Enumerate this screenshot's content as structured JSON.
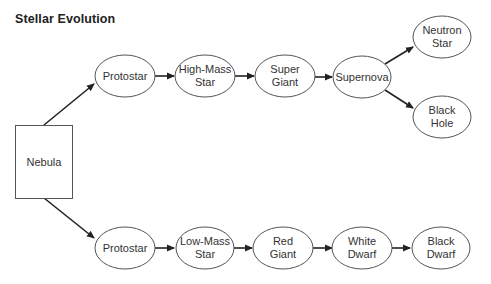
{
  "title": "Stellar Evolution",
  "colors": {
    "background": "#ffffff",
    "stroke": "#555555",
    "arrow": "#222222",
    "text": "#333333"
  },
  "nodes": {
    "nebula": {
      "label_lines": [
        "Nebula"
      ],
      "shape": "rect"
    },
    "protostar_high": {
      "label_lines": [
        "Protostar"
      ],
      "shape": "ellipse"
    },
    "high_mass_star": {
      "label_lines": [
        "High-Mass",
        "Star"
      ],
      "shape": "ellipse"
    },
    "super_giant": {
      "label_lines": [
        "Super",
        "Giant"
      ],
      "shape": "ellipse"
    },
    "supernova": {
      "label_lines": [
        "Supernova"
      ],
      "shape": "ellipse"
    },
    "neutron_star": {
      "label_lines": [
        "Neutron",
        "Star"
      ],
      "shape": "ellipse"
    },
    "black_hole": {
      "label_lines": [
        "Black",
        "Hole"
      ],
      "shape": "ellipse"
    },
    "protostar_low": {
      "label_lines": [
        "Protostar"
      ],
      "shape": "ellipse"
    },
    "low_mass_star": {
      "label_lines": [
        "Low-Mass",
        "Star"
      ],
      "shape": "ellipse"
    },
    "red_giant": {
      "label_lines": [
        "Red",
        "Giant"
      ],
      "shape": "ellipse"
    },
    "white_dwarf": {
      "label_lines": [
        "White",
        "Dwarf"
      ],
      "shape": "ellipse"
    },
    "black_dwarf": {
      "label_lines": [
        "Black",
        "Dwarf"
      ],
      "shape": "ellipse"
    }
  },
  "edges": [
    {
      "from": "nebula",
      "to": "protostar_high"
    },
    {
      "from": "protostar_high",
      "to": "high_mass_star"
    },
    {
      "from": "high_mass_star",
      "to": "super_giant"
    },
    {
      "from": "super_giant",
      "to": "supernova"
    },
    {
      "from": "supernova",
      "to": "neutron_star"
    },
    {
      "from": "supernova",
      "to": "black_hole"
    },
    {
      "from": "nebula",
      "to": "protostar_low"
    },
    {
      "from": "protostar_low",
      "to": "low_mass_star"
    },
    {
      "from": "low_mass_star",
      "to": "red_giant"
    },
    {
      "from": "red_giant",
      "to": "white_dwarf"
    },
    {
      "from": "white_dwarf",
      "to": "black_dwarf"
    }
  ]
}
